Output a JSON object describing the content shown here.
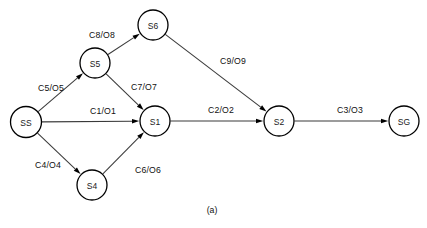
{
  "figure": {
    "caption": "(a)",
    "type": "state-transition-diagram",
    "colors": {
      "background": "#ffffff",
      "node_stroke": "#000000",
      "node_fill": "#ffffff",
      "edge_stroke": "#3a3a3a",
      "text": "#111111"
    }
  },
  "nodes": [
    {
      "id": "SS",
      "label": "SS",
      "cx": 26,
      "cy": 122,
      "r": 15.5
    },
    {
      "id": "S5",
      "label": "S5",
      "cx": 95,
      "cy": 63,
      "r": 15.0
    },
    {
      "id": "S6",
      "label": "S6",
      "cx": 153,
      "cy": 25,
      "r": 15.0
    },
    {
      "id": "S1",
      "label": "S1",
      "cx": 155,
      "cy": 121,
      "r": 15.0
    },
    {
      "id": "S4",
      "label": "S4",
      "cx": 92,
      "cy": 185,
      "r": 15.0
    },
    {
      "id": "S2",
      "label": "S2",
      "cx": 279,
      "cy": 121,
      "r": 15.0
    },
    {
      "id": "SG",
      "label": "SG",
      "cx": 404,
      "cy": 121,
      "r": 15.0
    }
  ],
  "edges": [
    {
      "from": "SS",
      "to": "S5",
      "label": "C5/O5",
      "lx": 51,
      "ly": 88
    },
    {
      "from": "SS",
      "to": "S1",
      "label": "C1/O1",
      "lx": 103,
      "ly": 111
    },
    {
      "from": "SS",
      "to": "S4",
      "label": "C4/O4",
      "lx": 48,
      "ly": 165
    },
    {
      "from": "S5",
      "to": "S6",
      "label": "C8/O8",
      "lx": 102,
      "ly": 35
    },
    {
      "from": "S5",
      "to": "S1",
      "label": "C7/O7",
      "lx": 144,
      "ly": 87
    },
    {
      "from": "S6",
      "to": "S2",
      "label": "C9/O9",
      "lx": 233,
      "ly": 61
    },
    {
      "from": "S4",
      "to": "S1",
      "label": "C6/O6",
      "lx": 148,
      "ly": 170
    },
    {
      "from": "S1",
      "to": "S2",
      "label": "C2/O2",
      "lx": 221,
      "ly": 110
    },
    {
      "from": "S2",
      "to": "SG",
      "label": "C3/O3",
      "lx": 350,
      "ly": 110
    }
  ]
}
